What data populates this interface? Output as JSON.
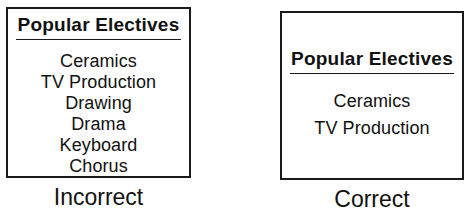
{
  "diagram": {
    "panels": [
      {
        "caption": "Incorrect",
        "box": {
          "title": "Popular  Electives",
          "items": [
            "Ceramics",
            "TV  Production",
            "Drawing",
            "Drama",
            "Keyboard",
            "Chorus"
          ]
        }
      },
      {
        "caption": "Correct",
        "box": {
          "title": "Popular  Electives",
          "items": [
            "Ceramics",
            "TV  Production"
          ]
        }
      }
    ],
    "colors": {
      "border": "#1a1a1a",
      "text": "#111111",
      "background": "#ffffff"
    }
  }
}
